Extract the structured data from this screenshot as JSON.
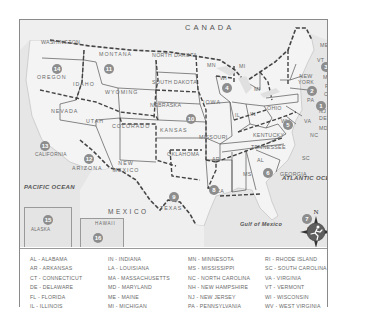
{
  "map": {
    "title_country_north": "CANADA",
    "title_country_south": "MEXICO",
    "oceans": {
      "pacific": "PACIFIC OCEAN",
      "atlantic": "ATLANTIC OCEAN",
      "gulf": "Gulf of Mexico"
    },
    "states": [
      {
        "id": "wa",
        "label": "WASHINGTON"
      },
      {
        "id": "or",
        "label": "OREGON"
      },
      {
        "id": "id",
        "label": "IDAHO"
      },
      {
        "id": "mt",
        "label": "MONTANA"
      },
      {
        "id": "wy",
        "label": "WYOMING"
      },
      {
        "id": "nd",
        "label": "NORTH DAKOTA"
      },
      {
        "id": "sd",
        "label": "SOUTH DAKOTA"
      },
      {
        "id": "ne",
        "label": "NEBRASKA"
      },
      {
        "id": "nv",
        "label": "NEVADA"
      },
      {
        "id": "ut",
        "label": "UTAH"
      },
      {
        "id": "co",
        "label": "COLORADO"
      },
      {
        "id": "ks",
        "label": "KANSAS"
      },
      {
        "id": "ca",
        "label": "CALIFORNIA"
      },
      {
        "id": "az",
        "label": "ARIZONA"
      },
      {
        "id": "nm",
        "label": "NEW MEXICO"
      },
      {
        "id": "ok",
        "label": "OKLAHOMA"
      },
      {
        "id": "tx",
        "label": "TEXAS"
      },
      {
        "id": "mn",
        "label": "MN"
      },
      {
        "id": "ia",
        "label": "IOWA"
      },
      {
        "id": "mo",
        "label": "MISSOURI"
      },
      {
        "id": "ar",
        "label": "AR"
      },
      {
        "id": "la",
        "label": "LA"
      },
      {
        "id": "wi",
        "label": "WI"
      },
      {
        "id": "il",
        "label": "IL"
      },
      {
        "id": "mi_up",
        "label": "MI"
      },
      {
        "id": "mi",
        "label": "MI"
      },
      {
        "id": "in",
        "label": "IN"
      },
      {
        "id": "oh",
        "label": "OHIO"
      },
      {
        "id": "ky",
        "label": "KENTUCKY"
      },
      {
        "id": "tn",
        "label": "TENNESSEE"
      },
      {
        "id": "ms",
        "label": "MS"
      },
      {
        "id": "al",
        "label": "AL"
      },
      {
        "id": "ga",
        "label": "GEORGIA"
      },
      {
        "id": "fl",
        "label": "FL"
      },
      {
        "id": "sc",
        "label": "SC"
      },
      {
        "id": "nc",
        "label": "NC"
      },
      {
        "id": "va",
        "label": "VA"
      },
      {
        "id": "wv",
        "label": "WV"
      },
      {
        "id": "pa",
        "label": "PA"
      },
      {
        "id": "ny",
        "label": "NEW YORK"
      },
      {
        "id": "vt",
        "label": "VT"
      },
      {
        "id": "nh",
        "label": "NH"
      },
      {
        "id": "me",
        "label": "ME"
      },
      {
        "id": "ma",
        "label": "MA"
      },
      {
        "id": "ri",
        "label": "RI"
      },
      {
        "id": "ct",
        "label": "CT"
      },
      {
        "id": "nj",
        "label": "NJ"
      },
      {
        "id": "de",
        "label": "DE"
      },
      {
        "id": "md",
        "label": "MD"
      },
      {
        "id": "ak",
        "label": "ALASKA"
      },
      {
        "id": "hi",
        "label": "HAWAII"
      }
    ],
    "region_badges": [
      "1",
      "2",
      "3",
      "4",
      "5",
      "6",
      "7",
      "8",
      "9",
      "10",
      "11",
      "12",
      "13",
      "14",
      "15",
      "16"
    ],
    "compass_label": "N"
  },
  "legend": {
    "columns": [
      [
        "AL - ALABAMA",
        "AR - ARKANSAS",
        "CT - CONNECTICUT",
        "DE - DELAWARE",
        "FL - FLORIDA",
        "IL - ILLINOIS"
      ],
      [
        "IN - INDIANA",
        "LA - LOUISIANA",
        "MA - MASSACHUSETTS",
        "MD - MARYLAND",
        "ME - MAINE",
        "MI - MICHIGAN"
      ],
      [
        "MN - MINNESOTA",
        "MS - MISSISSIPPI",
        "NC - NORTH CAROLINA",
        "NH - NEW HAMPSHIRE",
        "NJ - NEW JERSEY",
        "PA - PENNSYLVANIA"
      ],
      [
        "RI - RHODE ISLAND",
        "SC - SOUTH CAROLINA",
        "VA - VIRGINIA",
        "VT - VERMONT",
        "WI - WISCONSIN",
        "WV - WEST VIRGINIA"
      ]
    ]
  },
  "colors": {
    "land": "#f3f3f3",
    "water": "#e2e2e2",
    "badge": "#8d8d8d",
    "border": "#555555",
    "text": "#6a6a6a"
  }
}
